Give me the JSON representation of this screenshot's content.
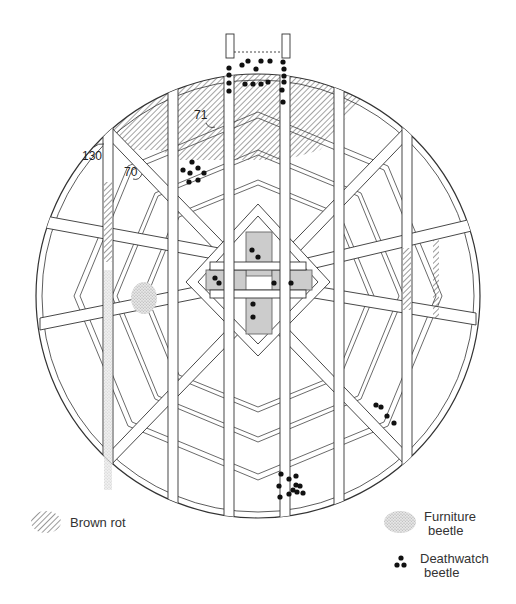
{
  "diagram": {
    "callouts": [
      {
        "label": "71",
        "x": 200,
        "y": 118
      },
      {
        "label": "130",
        "x": 82,
        "y": 158
      },
      {
        "label": "70",
        "x": 124,
        "y": 176
      }
    ]
  },
  "legend": {
    "brown_rot": {
      "label": "Brown rot",
      "symbol": "diagonal-hatch"
    },
    "furniture_beetle": {
      "label_line1": "Furniture",
      "label_line2": "beetle",
      "symbol": "stippled-patch"
    },
    "deathwatch_beetle": {
      "label_line1": "Deathwatch",
      "label_line2": "beetle",
      "symbol": "three-dots"
    }
  },
  "colors": {
    "line": "#333333",
    "hatch": "#444444",
    "stipple": "#bbbbbb",
    "dot": "#111111",
    "background": "#ffffff"
  }
}
